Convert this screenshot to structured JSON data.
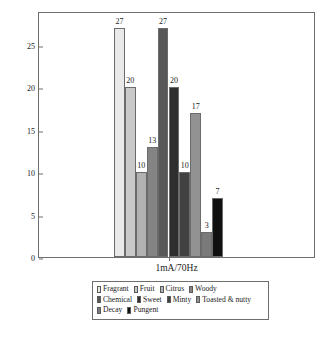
{
  "chart_data": {
    "type": "bar",
    "title": "",
    "subtitle": "",
    "xlabel": "1mA/70Hz",
    "ylabel": "Percentage",
    "categories": [
      "Fragrant",
      "Fruit",
      "Citrus",
      "Woody",
      "Chemical",
      "Sweet",
      "Minty",
      "Toasted & nutty",
      "Decay",
      "Pungent"
    ],
    "values": [
      27,
      20,
      10,
      13,
      27,
      20,
      10,
      17,
      3,
      7
    ],
    "colors": [
      "#e9e9e9",
      "#c9c9c9",
      "#b2b2b2",
      "#848484",
      "#585858",
      "#2e2e2e",
      "#414141",
      "#929292",
      "#7a7a7a",
      "#101010"
    ],
    "ylim": [
      0,
      29
    ],
    "yticks": [
      "0",
      "5",
      "10",
      "15",
      "20",
      "25"
    ],
    "ytick_values": [
      0,
      5,
      10,
      15,
      20,
      25
    ],
    "xticks": [
      "1mA/70Hz"
    ],
    "grid": false,
    "legend_position": "below-axes",
    "legend_rows": [
      [
        "Fragrant",
        "Fruit",
        "Citrus",
        "Woody"
      ],
      [
        "Chemical",
        "Sweet",
        "Minty",
        "Toasted & nutty"
      ],
      [
        "Decay",
        "Pungent"
      ]
    ],
    "data_labels": [
      "27",
      "20",
      "10",
      "13",
      "27",
      "20",
      "10",
      "17",
      "3",
      "7"
    ]
  }
}
